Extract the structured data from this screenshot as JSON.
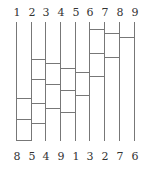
{
  "diagram": {
    "type": "ladder (amidakuji)",
    "top_labels": [
      "1",
      "2",
      "3",
      "4",
      "5",
      "6",
      "7",
      "8",
      "9"
    ],
    "bottom_labels": [
      "8",
      "5",
      "4",
      "9",
      "1",
      "3",
      "2",
      "7",
      "6"
    ],
    "line_x": [
      16,
      31,
      45,
      60,
      75,
      89,
      104,
      119,
      134
    ],
    "line_top": 22,
    "line_bottom": 141,
    "rungs": [
      {
        "from": 6,
        "to": 7,
        "y": 29
      },
      {
        "from": 7,
        "to": 8,
        "y": 33
      },
      {
        "from": 8,
        "to": 9,
        "y": 37
      },
      {
        "from": 6,
        "to": 7,
        "y": 53
      },
      {
        "from": 7,
        "to": 8,
        "y": 57
      },
      {
        "from": 2,
        "to": 3,
        "y": 59
      },
      {
        "from": 3,
        "to": 4,
        "y": 63
      },
      {
        "from": 4,
        "to": 5,
        "y": 68
      },
      {
        "from": 5,
        "to": 6,
        "y": 72
      },
      {
        "from": 6,
        "to": 7,
        "y": 76
      },
      {
        "from": 2,
        "to": 3,
        "y": 79
      },
      {
        "from": 3,
        "to": 4,
        "y": 84
      },
      {
        "from": 4,
        "to": 5,
        "y": 90
      },
      {
        "from": 5,
        "to": 6,
        "y": 95
      },
      {
        "from": 1,
        "to": 2,
        "y": 98
      },
      {
        "from": 2,
        "to": 3,
        "y": 103
      },
      {
        "from": 3,
        "to": 4,
        "y": 108
      },
      {
        "from": 4,
        "to": 5,
        "y": 112
      },
      {
        "from": 1,
        "to": 2,
        "y": 119
      },
      {
        "from": 2,
        "to": 3,
        "y": 123
      },
      {
        "from": 1,
        "to": 2,
        "y": 140
      }
    ],
    "line_color": "#777777",
    "text_color": "#333333"
  }
}
